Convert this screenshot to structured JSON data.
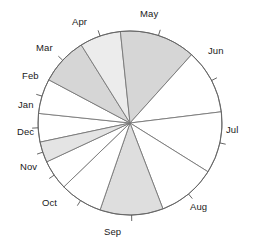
{
  "chart_data": {
    "type": "pie",
    "title": "",
    "subtitle": "",
    "xlabel": "",
    "ylabel": "",
    "grid": false,
    "legend": "none",
    "labels_on_perimeter": true,
    "start_angle_deg": 168,
    "direction": "clockwise",
    "categories": [
      "Jan",
      "Feb",
      "Mar",
      "Apr",
      "May",
      "Jun",
      "Jul",
      "Aug",
      "Sep",
      "Oct",
      "Nov",
      "Dec"
    ],
    "values": [
      5.0,
      6.1,
      8.3,
      7.2,
      13.3,
      11.4,
      10.8,
      10.3,
      11.1,
      7.5,
      5.3,
      3.7
    ],
    "units": "percent",
    "slices": [
      {
        "label": "Jan",
        "value": 5.0,
        "start_deg": 258.0,
        "end_deg": 276.0,
        "fill": "#ffffff",
        "shade": "white"
      },
      {
        "label": "Feb",
        "value": 6.1,
        "start_deg": 276.0,
        "end_deg": 298.0,
        "fill": "#ffffff",
        "shade": "white"
      },
      {
        "label": "Mar",
        "value": 8.3,
        "start_deg": 298.0,
        "end_deg": 328.0,
        "fill": "#d6d6d6",
        "shade": "gray"
      },
      {
        "label": "Apr",
        "value": 7.2,
        "start_deg": 328.0,
        "end_deg": 354.0,
        "fill": "#ececec",
        "shade": "light-gray"
      },
      {
        "label": "May",
        "value": 13.3,
        "start_deg": 354.0,
        "end_deg": 402.0,
        "fill": "#d6d6d6",
        "shade": "gray"
      },
      {
        "label": "Jun",
        "value": 11.4,
        "start_deg": 402.0,
        "end_deg": 443.0,
        "fill": "#ffffff",
        "shade": "white"
      },
      {
        "label": "Jul",
        "value": 10.8,
        "start_deg": 443.0,
        "end_deg": 482.0,
        "fill": "#ffffff",
        "shade": "white"
      },
      {
        "label": "Aug",
        "value": 10.3,
        "start_deg": 482.0,
        "end_deg": 519.0,
        "fill": "#ffffff",
        "shade": "white"
      },
      {
        "label": "Sep",
        "value": 11.1,
        "start_deg": 519.0,
        "end_deg": 559.0,
        "fill": "#dedede",
        "shade": "gray"
      },
      {
        "label": "Oct",
        "value": 7.5,
        "start_deg": 559.0,
        "end_deg": 586.0,
        "fill": "#ffffff",
        "shade": "white"
      },
      {
        "label": "Nov",
        "value": 5.3,
        "start_deg": 586.0,
        "end_deg": 605.0,
        "fill": "#ffffff",
        "shade": "white"
      },
      {
        "label": "Dec",
        "value": 3.7,
        "start_deg": 605.0,
        "end_deg": 618.0,
        "fill": "#e4e4e4",
        "shade": "light-gray"
      }
    ],
    "geometry": {
      "center_x": 130,
      "center_y": 123,
      "radius": 92,
      "tick_length": 6
    },
    "label_positions": [
      {
        "label": "Jan",
        "x": 18,
        "y": 100,
        "anchor_deg": 267.0
      },
      {
        "label": "Feb",
        "x": 22,
        "y": 71,
        "anchor_deg": 287.0
      },
      {
        "label": "Mar",
        "x": 36,
        "y": 43,
        "anchor_deg": 313.0
      },
      {
        "label": "Apr",
        "x": 72,
        "y": 17,
        "anchor_deg": 341.0
      },
      {
        "label": "May",
        "x": 140,
        "y": 9,
        "anchor_deg": 378.0
      },
      {
        "label": "Jun",
        "x": 208,
        "y": 46,
        "anchor_deg": 422.5
      },
      {
        "label": "Jul",
        "x": 226,
        "y": 125,
        "anchor_deg": 462.5
      },
      {
        "label": "Aug",
        "x": 190,
        "y": 202,
        "anchor_deg": 500.5
      },
      {
        "label": "Sep",
        "x": 104,
        "y": 227,
        "anchor_deg": 539.0
      },
      {
        "label": "Oct",
        "x": 42,
        "y": 198,
        "anchor_deg": 572.5
      },
      {
        "label": "Nov",
        "x": 20,
        "y": 162,
        "anchor_deg": 595.5
      },
      {
        "label": "Dec",
        "x": 17,
        "y": 127,
        "anchor_deg": 611.5
      }
    ],
    "palette": {
      "background": "#ffffff",
      "outline": "#666666",
      "slice_border": "#777777",
      "shade_gray": "#d6d6d6",
      "shade_light": "#ececec",
      "shade_white": "#ffffff",
      "text": "#1a1a1a"
    }
  }
}
